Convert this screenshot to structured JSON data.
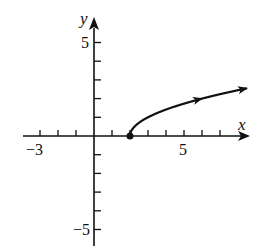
{
  "chart_data": {
    "type": "line",
    "title": "",
    "xlabel": "x",
    "ylabel": "y",
    "xlim": [
      -4,
      8.6
    ],
    "ylim": [
      -6,
      6.3
    ],
    "x_ticks": [
      -3,
      -2,
      -1,
      1,
      2,
      3,
      4,
      5,
      6,
      7
    ],
    "y_ticks": [
      -5,
      -4,
      -3,
      -2,
      -1,
      1,
      2,
      3,
      4,
      5
    ],
    "x_tick_labels": [
      {
        "value": -3,
        "text": "−3"
      },
      {
        "value": 5,
        "text": "5"
      }
    ],
    "y_tick_labels": [
      {
        "value": 5,
        "text": "5"
      },
      {
        "value": -5,
        "text": "−5"
      }
    ],
    "grid": false,
    "series": [
      {
        "name": "y = sqrt(x - 2)",
        "start_point": {
          "x": 2,
          "y": 0,
          "marker": "closed-dot"
        },
        "x": [
          2,
          2.25,
          3,
          4,
          5,
          6,
          7,
          8,
          8.5
        ],
        "y": [
          0,
          0.5,
          1,
          1.41,
          1.73,
          2,
          2.24,
          2.45,
          2.55
        ],
        "arrows": [
          {
            "x": 6,
            "y": 2
          },
          {
            "x": 8.5,
            "y": 2.55
          }
        ]
      }
    ]
  },
  "labels": {
    "x_axis": "x",
    "y_axis": "y",
    "x_neg3": "−3",
    "x_5": "5",
    "y_5": "5",
    "y_neg5": "−5"
  }
}
